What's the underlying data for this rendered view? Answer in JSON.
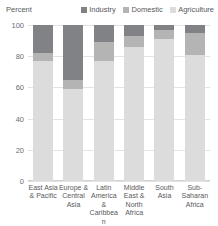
{
  "chart_data": {
    "type": "bar",
    "stacked": true,
    "stacked_normalized": true,
    "title": "",
    "subtitle": "",
    "xlabel": "",
    "ylabel": "Percent",
    "ylim": [
      0,
      100
    ],
    "yticks": [
      0,
      20,
      40,
      60,
      80,
      100
    ],
    "ytick_labels": [
      "0",
      "20",
      "40",
      "60",
      "80",
      "100"
    ],
    "grid": true,
    "grid_axis": "y",
    "legend_position": "top-right",
    "categories": [
      "East Asia & Pacific",
      "Europe & Central Asia",
      "Latin America & Caribbean",
      "Middle East & North Africa",
      "South Asia",
      "Sub-Saharan Africa"
    ],
    "category_label_lines": [
      [
        "East",
        "Asia",
        "&",
        "Pacific"
      ],
      [
        "Europe",
        "&",
        "Central",
        "Asia"
      ],
      [
        "Latin",
        "America",
        "&",
        "Caribbean"
      ],
      [
        "Middle",
        "East &",
        "North",
        "Africa"
      ],
      [
        "South",
        "Asia"
      ],
      [
        "Sub-",
        "Saharan",
        "Africa"
      ]
    ],
    "series": [
      {
        "name": "Agriculture",
        "color": "#dcdcdc",
        "values": [
          77,
          59,
          77,
          86,
          91,
          81
        ]
      },
      {
        "name": "Domestic",
        "color": "#b4b4b4",
        "values": [
          5,
          6,
          12,
          7,
          6,
          14
        ]
      },
      {
        "name": "Industry",
        "color": "#808285",
        "values": [
          18,
          35,
          11,
          7,
          3,
          5
        ]
      }
    ],
    "legend": [
      {
        "label": "Industry",
        "color": "#808285"
      },
      {
        "label": "Domestic",
        "color": "#b4b4b4"
      },
      {
        "label": "Agriculture",
        "color": "#dcdcdc"
      }
    ]
  }
}
